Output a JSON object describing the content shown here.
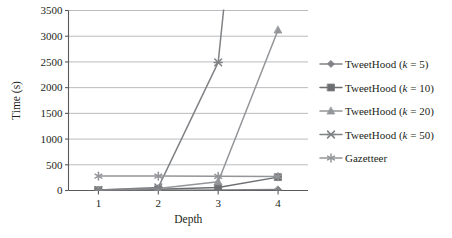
{
  "chart_data": {
    "type": "line",
    "title": "",
    "xlabel": "Depth",
    "ylabel": "Time (s)",
    "categories": [
      "1",
      "2",
      "3",
      "4"
    ],
    "x": [
      1,
      2,
      3,
      4
    ],
    "ylim": [
      0,
      3500
    ],
    "yticks": [
      0,
      500,
      1000,
      1500,
      2000,
      2500,
      3000,
      3500
    ],
    "ytick_labels": [
      "0",
      "500",
      "1000",
      "1500",
      "2000",
      "2500",
      "3000",
      "3500"
    ],
    "xtick_labels": [
      "1",
      "2",
      "3",
      "4"
    ],
    "grid": "horizontal",
    "legend_position": "right",
    "series": [
      {
        "name": "TweetHood (k = 5)",
        "label_prefix": "TweetHood (",
        "label_italic": "k",
        "label_suffix": " = 5)",
        "marker": "diamond",
        "color": "#808285",
        "values": [
          2,
          6,
          12,
          20
        ]
      },
      {
        "name": "TweetHood (k = 10)",
        "label_prefix": "TweetHood (",
        "label_italic": "k",
        "label_suffix": " = 10)",
        "marker": "square",
        "color": "#6d6e71",
        "values": [
          5,
          25,
          60,
          260
        ]
      },
      {
        "name": "TweetHood (k = 20)",
        "label_prefix": "TweetHood (",
        "label_italic": "k",
        "label_suffix": " = 20)",
        "marker": "triangle",
        "color": "#939598",
        "values": [
          8,
          40,
          170,
          3120
        ]
      },
      {
        "name": "TweetHood (k = 50)",
        "label_prefix": "TweetHood (",
        "label_italic": "k",
        "label_suffix": " = 50)",
        "marker": "cross-x",
        "color": "#808285",
        "values": [
          12,
          60,
          2490,
          13800
        ]
      },
      {
        "name": "Gazetteer",
        "label_prefix": "Gazetteer",
        "label_italic": "",
        "label_suffix": "",
        "marker": "asterisk",
        "color": "#939598",
        "values": [
          280,
          280,
          275,
          270
        ]
      }
    ]
  },
  "axes": {
    "y_title": "Time (s)",
    "x_title": "Depth"
  },
  "legend": {
    "entries": [
      {
        "label": "TweetHood (k = 5)",
        "marker": "diamond-marker-icon"
      },
      {
        "label": "TweetHood (k = 10)",
        "marker": "square-marker-icon"
      },
      {
        "label": "TweetHood (k = 20)",
        "marker": "triangle-marker-icon"
      },
      {
        "label": "TweetHood (k = 50)",
        "marker": "cross-marker-icon"
      },
      {
        "label": "Gazetteer",
        "marker": "asterisk-marker-icon"
      }
    ]
  },
  "colors": {
    "axis": "#58595b",
    "grid": "#a7a9ac",
    "text": "#231f20",
    "background": "#ffffff"
  }
}
